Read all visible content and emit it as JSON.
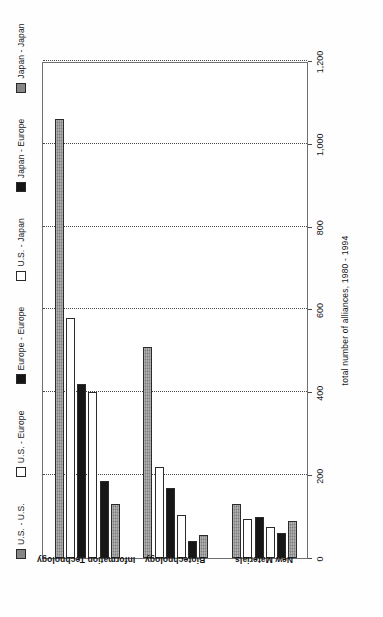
{
  "chart_data": {
    "type": "bar",
    "orientation": "horizontal",
    "title": "",
    "xlabel": "total number of alliances, 1980 - 1994",
    "ylabel": "",
    "categories": [
      "Information Technology",
      "Biotechnology",
      "New Materials"
    ],
    "xlim": [
      0,
      1200
    ],
    "ticks": [
      "0",
      "200",
      "400",
      "600",
      "800",
      "1,000",
      "1,200"
    ],
    "tick_values": [
      0,
      200,
      400,
      600,
      800,
      1000,
      1200
    ],
    "grid": true,
    "grid_axis": "x",
    "legend_position": "top",
    "series": [
      {
        "name": "U.S. - U.S.",
        "swatch": "grey",
        "values": [
          1060,
          510,
          130
        ]
      },
      {
        "name": "U.S. - Europe",
        "swatch": "white",
        "values": [
          580,
          220,
          95
        ]
      },
      {
        "name": "Europe - Europe",
        "swatch": "black",
        "values": [
          420,
          170,
          100
        ]
      },
      {
        "name": "U.S. - Japan",
        "swatch": "white",
        "values": [
          400,
          105,
          75
        ]
      },
      {
        "name": "Japan - Europe",
        "swatch": "black",
        "values": [
          185,
          40,
          60
        ]
      },
      {
        "name": "Japan - Japan",
        "swatch": "grey",
        "values": [
          130,
          55,
          90
        ]
      }
    ]
  },
  "colors": {
    "grey": "#8c8c8c",
    "white": "#ffffff",
    "black": "#171717",
    "axis": "#4a4a4a",
    "text": "#161616"
  }
}
